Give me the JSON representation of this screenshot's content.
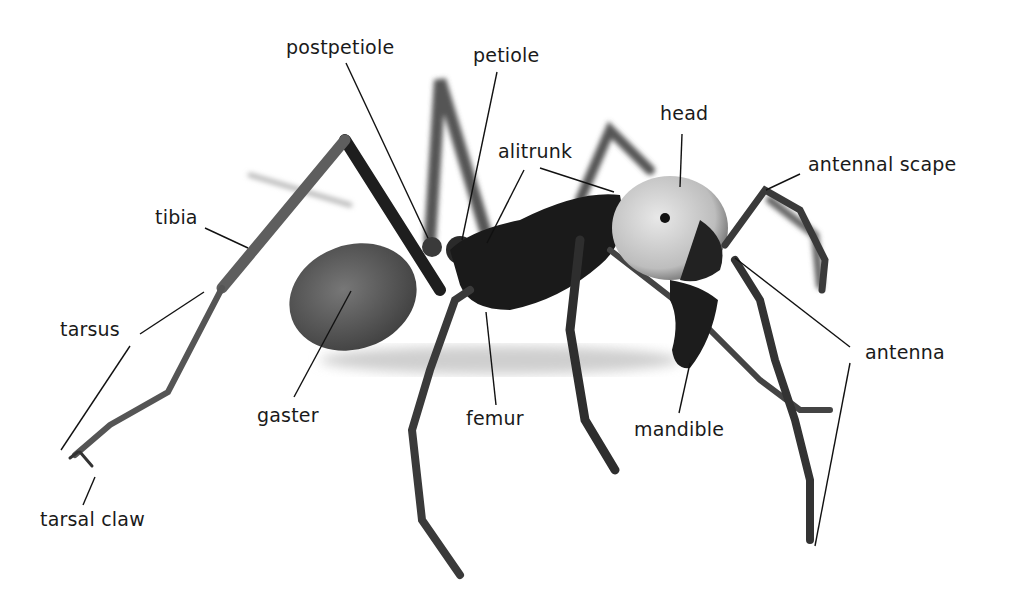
{
  "diagram": {
    "labels": [
      {
        "id": "postpetiole",
        "text": "postpetiole",
        "x": 286,
        "y": 36
      },
      {
        "id": "petiole",
        "text": "petiole",
        "x": 473,
        "y": 44
      },
      {
        "id": "head",
        "text": "head",
        "x": 660,
        "y": 102
      },
      {
        "id": "alitrunk",
        "text": "alitrunk",
        "x": 498,
        "y": 140
      },
      {
        "id": "antennal-scape",
        "text": "antennal scape",
        "x": 808,
        "y": 153
      },
      {
        "id": "tibia",
        "text": "tibia",
        "x": 155,
        "y": 206
      },
      {
        "id": "tarsus",
        "text": "tarsus",
        "x": 60,
        "y": 318
      },
      {
        "id": "antenna",
        "text": "antenna",
        "x": 865,
        "y": 341
      },
      {
        "id": "gaster",
        "text": "gaster",
        "x": 257,
        "y": 404
      },
      {
        "id": "femur",
        "text": "femur",
        "x": 466,
        "y": 407
      },
      {
        "id": "mandible",
        "text": "mandible",
        "x": 634,
        "y": 418
      },
      {
        "id": "tarsal-claw",
        "text": "tarsal claw",
        "x": 40,
        "y": 508
      }
    ],
    "leader_lines": [
      {
        "label": "postpetiole",
        "x1": 346,
        "y1": 63,
        "x2": 428,
        "y2": 238
      },
      {
        "label": "petiole",
        "x1": 497,
        "y1": 72,
        "x2": 462,
        "y2": 240
      },
      {
        "label": "alitrunk",
        "x1": 524,
        "y1": 170,
        "x2": 487,
        "y2": 243
      },
      {
        "label": "alitrunk",
        "x1": 540,
        "y1": 168,
        "x2": 614,
        "y2": 192
      },
      {
        "label": "head",
        "x1": 682,
        "y1": 134,
        "x2": 680,
        "y2": 187
      },
      {
        "label": "antennal scape",
        "x1": 800,
        "y1": 174,
        "x2": 766,
        "y2": 190
      },
      {
        "label": "tibia",
        "x1": 205,
        "y1": 228,
        "x2": 248,
        "y2": 248
      },
      {
        "label": "tarsus",
        "x1": 140,
        "y1": 334,
        "x2": 204,
        "y2": 292
      },
      {
        "label": "tarsus",
        "x1": 130,
        "y1": 346,
        "x2": 61,
        "y2": 450
      },
      {
        "label": "tarsal claw",
        "x1": 95,
        "y1": 477,
        "x2": 83,
        "y2": 505
      },
      {
        "label": "gaster",
        "x1": 294,
        "y1": 397,
        "x2": 351,
        "y2": 291
      },
      {
        "label": "femur",
        "x1": 496,
        "y1": 405,
        "x2": 486,
        "y2": 312
      },
      {
        "label": "mandible",
        "x1": 679,
        "y1": 413,
        "x2": 690,
        "y2": 363
      },
      {
        "label": "antenna",
        "x1": 850,
        "y1": 347,
        "x2": 735,
        "y2": 258
      },
      {
        "label": "antenna",
        "x1": 850,
        "y1": 363,
        "x2": 815,
        "y2": 546
      }
    ]
  }
}
